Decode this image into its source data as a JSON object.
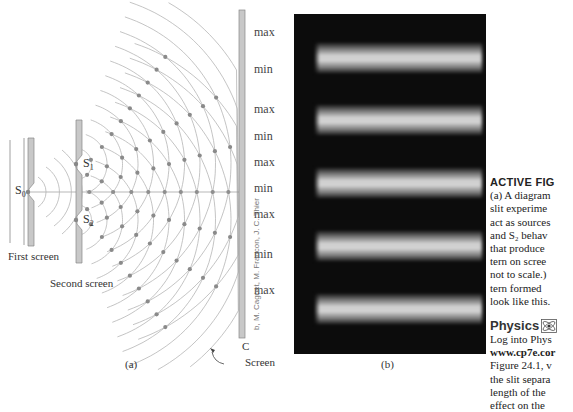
{
  "figure": {
    "panel_a": {
      "caption": "(a)",
      "labels": {
        "s0": "S",
        "s0_sub": "0",
        "s1": "S",
        "s1_sub": "1",
        "s2": "S",
        "s2_sub": "2",
        "first_screen": "First screen",
        "second_screen": "Second screen",
        "screen_c": "C",
        "screen": "Screen"
      },
      "fringe_labels": [
        "max",
        "min",
        "max",
        "min",
        "max",
        "min",
        "max",
        "min",
        "max"
      ],
      "colors": {
        "wave_lines": "#b5b5b5",
        "dots": "#8a8a8a",
        "screen_fill": "#c8c8c8"
      }
    },
    "panel_b": {
      "caption": "(b)",
      "credit": "b, M. Cagnet, M. Francon, J. C. Thier",
      "bright_fringe_count": 5
    }
  },
  "sidebar": {
    "title": "ACTIVE FIG",
    "caption_lines": [
      "(a) A diagram",
      "slit experime",
      "act as sources",
      "and S₂ behav",
      "that produce",
      "tern on scree",
      "not to scale.)",
      "tern formed",
      "look like this."
    ],
    "physics_label": "Physics",
    "physics_icon": "atom-icon",
    "body_lines": [
      {
        "text": "Log into Phys",
        "bold": false
      },
      {
        "text": "www.cp7e.cor",
        "bold": true
      },
      {
        "text": "Figure 24.1, v",
        "bold": false
      },
      {
        "text": "the slit separa",
        "bold": false
      },
      {
        "text": "length of the",
        "bold": false
      },
      {
        "text": "effect on the",
        "bold": false
      }
    ]
  }
}
